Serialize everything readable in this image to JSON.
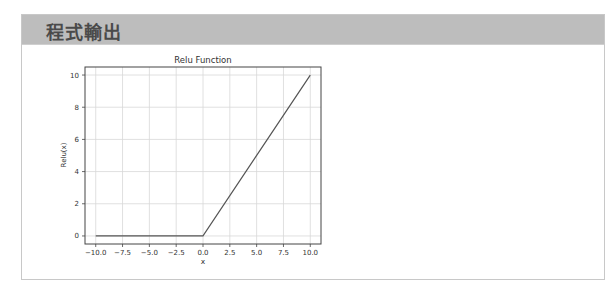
{
  "panel": {
    "title": "程式輸出"
  },
  "chart_data": {
    "type": "line",
    "title": "Relu Function",
    "xlabel": "x",
    "ylabel": "Relu(x)",
    "xlim": [
      -11,
      11
    ],
    "ylim": [
      -0.5,
      10.5
    ],
    "grid": true,
    "legend": false,
    "x_ticks": [
      "-10.0",
      "-7.5",
      "-5.0",
      "-2.5",
      "0.0",
      "2.5",
      "5.0",
      "7.5",
      "10.0"
    ],
    "y_ticks": [
      "0",
      "2",
      "4",
      "6",
      "8",
      "10"
    ],
    "series": [
      {
        "name": "Relu(x)",
        "color": "#555555",
        "x": [
          -10,
          0,
          10
        ],
        "y": [
          0,
          0,
          10
        ]
      }
    ]
  }
}
